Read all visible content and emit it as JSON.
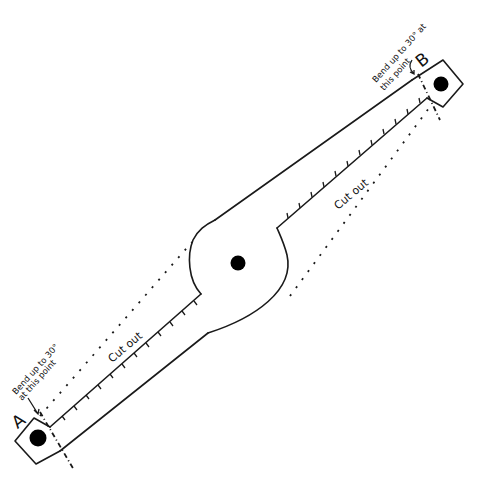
{
  "diagram": {
    "colors": {
      "stroke": "#1a1a1a",
      "hole": "#000000",
      "background": "#ffffff"
    },
    "labels": {
      "point_a": "A",
      "point_b": "B",
      "cut_out_left": "Cut out",
      "cut_out_right": "Cut out",
      "bend_a_line1": "Bend up to 30°",
      "bend_a_line2": "at this point",
      "bend_b_line1": "Bend up to 30° at",
      "bend_b_line2": "this point"
    },
    "parts": {
      "tab_a": {
        "label": "A",
        "hole": "mounting hole"
      },
      "tab_b": {
        "label": "B",
        "hole": "mounting hole"
      },
      "center_hub": {
        "hole": "pivot hole"
      }
    }
  }
}
